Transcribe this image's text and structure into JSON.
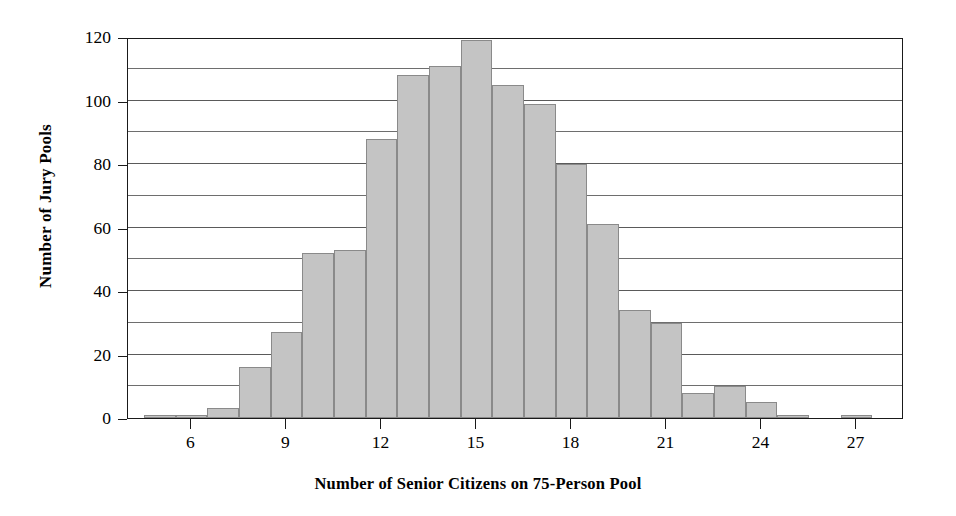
{
  "chart_data": {
    "type": "bar",
    "title": "",
    "xlabel": "Number of Senior Citizens on 75-Person Pool",
    "ylabel": "Number of Jury Pools",
    "xlim": [
      4,
      28.5
    ],
    "ylim": [
      0,
      120
    ],
    "xticks": [
      6,
      9,
      12,
      15,
      18,
      21,
      24,
      27
    ],
    "xtick_labels": [
      "6",
      "9",
      "12",
      "15",
      "18",
      "21",
      "24",
      "27"
    ],
    "yticks": [
      0,
      20,
      40,
      60,
      80,
      100,
      120
    ],
    "ytick_labels": [
      "0",
      "20",
      "40",
      "60",
      "80",
      "100",
      "120"
    ],
    "gridlines_y": [
      10,
      20,
      30,
      40,
      50,
      60,
      70,
      80,
      90,
      100,
      110
    ],
    "grid": "horizontal",
    "legend": null,
    "bin_width": 1,
    "bar_color": "#c4c4c4",
    "bar_edge_color": "#8a8a8a",
    "categories": [
      5,
      6,
      7,
      8,
      9,
      10,
      11,
      12,
      13,
      14,
      15,
      16,
      17,
      18,
      19,
      20,
      21,
      22,
      23,
      24,
      25,
      27
    ],
    "values": [
      1,
      1,
      3,
      16,
      27,
      52,
      53,
      88,
      108,
      111,
      119,
      105,
      99,
      80,
      61,
      34,
      30,
      8,
      10,
      5,
      1,
      1
    ],
    "bars": [
      {
        "x": 5,
        "value": 1
      },
      {
        "x": 6,
        "value": 1
      },
      {
        "x": 7,
        "value": 3
      },
      {
        "x": 8,
        "value": 16
      },
      {
        "x": 9,
        "value": 27
      },
      {
        "x": 10,
        "value": 52
      },
      {
        "x": 11,
        "value": 53
      },
      {
        "x": 12,
        "value": 88
      },
      {
        "x": 13,
        "value": 108
      },
      {
        "x": 14,
        "value": 111
      },
      {
        "x": 15,
        "value": 119
      },
      {
        "x": 16,
        "value": 105
      },
      {
        "x": 17,
        "value": 99
      },
      {
        "x": 18,
        "value": 80
      },
      {
        "x": 19,
        "value": 61
      },
      {
        "x": 20,
        "value": 34
      },
      {
        "x": 21,
        "value": 30
      },
      {
        "x": 22,
        "value": 8
      },
      {
        "x": 23,
        "value": 10
      },
      {
        "x": 24,
        "value": 5
      },
      {
        "x": 25,
        "value": 1
      },
      {
        "x": 27,
        "value": 1
      }
    ]
  }
}
